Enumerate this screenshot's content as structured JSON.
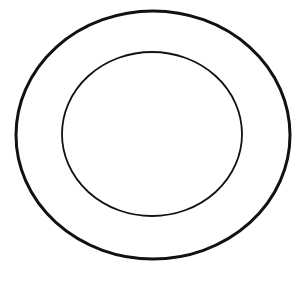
{
  "diagram": {
    "shapes": [
      {
        "type": "ellipse",
        "name": "outer-ring",
        "cx": 153,
        "cy": 135,
        "rx": 137,
        "ry": 124,
        "stroke": "#111111",
        "stroke_width": 3
      },
      {
        "type": "ellipse",
        "name": "inner-ring",
        "cx": 152,
        "cy": 134,
        "rx": 90,
        "ry": 82,
        "stroke": "#111111",
        "stroke_width": 1.8
      }
    ],
    "background": "#ffffff"
  }
}
